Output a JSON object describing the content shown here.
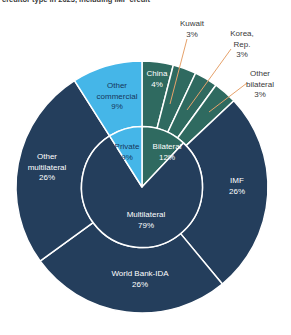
{
  "page": {
    "background": "#ffffff"
  },
  "header": {
    "title_fragment": "creditor type in 2023, including IMF credit"
  },
  "colors": {
    "navy": "#243E5C",
    "teal": "#2F6A60",
    "light_blue": "#45B6E8",
    "leader_line": "#E6A26B",
    "outside_text": "#3A3A3A",
    "dark_text_on_blue": "#17365C",
    "white_text": "#FFFFFF",
    "separator": "#FFFFFF"
  },
  "chart_data": {
    "type": "pie",
    "subtype": "nested-donut",
    "title": "creditor type in 2023, including IMF credit",
    "units": "%",
    "legend_position": "none",
    "inner_ring": [
      {
        "id": "bilateral",
        "label": "Bilateral",
        "value": 12,
        "color": "teal",
        "text": "white_text"
      },
      {
        "id": "multilateral",
        "label": "Multilateral",
        "value": 79,
        "color": "navy",
        "text": "white_text"
      },
      {
        "id": "private",
        "label": "Private",
        "value": 9,
        "color": "light_blue",
        "text": "dark_text_on_blue"
      }
    ],
    "outer_ring": [
      {
        "id": "china",
        "label": "China",
        "value": 4,
        "color": "teal",
        "text": "white_text",
        "label_placement": "inside"
      },
      {
        "id": "kuwait",
        "label": "Kuwait",
        "value": 3,
        "color": "teal",
        "text": "outside_text",
        "label_placement": "outside"
      },
      {
        "id": "korea",
        "label": "Korea, Rep.",
        "value": 3,
        "color": "teal",
        "text": "outside_text",
        "label_placement": "outside"
      },
      {
        "id": "other-bilateral",
        "label": "Other bilateral",
        "value": 3,
        "color": "teal",
        "text": "outside_text",
        "label_placement": "outside"
      },
      {
        "id": "imf",
        "label": "IMF",
        "value": 26,
        "color": "navy",
        "text": "white_text",
        "label_placement": "inside"
      },
      {
        "id": "world-bank-ida",
        "label": "World Bank-IDA",
        "value": 26,
        "color": "navy",
        "text": "white_text",
        "label_placement": "inside"
      },
      {
        "id": "other-multilateral",
        "label": "Other multilateral",
        "value": 26,
        "color": "navy",
        "text": "white_text",
        "label_placement": "inside"
      },
      {
        "id": "other-commercial",
        "label": "Other commercial",
        "value": 9,
        "color": "light_blue",
        "text": "dark_text_on_blue",
        "label_placement": "inside"
      }
    ]
  }
}
